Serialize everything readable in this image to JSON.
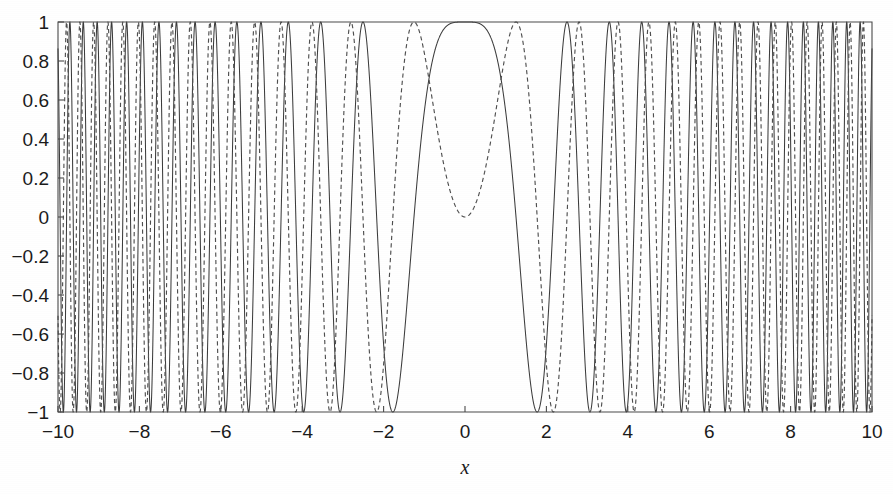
{
  "figure": {
    "background_color": "#ffffff",
    "line_color": "#3c3c3c",
    "axis_color": "#4a4a4a"
  },
  "chart_data": {
    "type": "line",
    "title": "",
    "subtitle": "",
    "xlabel": "x",
    "ylabel": "",
    "xlim": [
      -10,
      10
    ],
    "ylim": [
      -1,
      1
    ],
    "grid": false,
    "legend": "none",
    "xticks": [
      -10,
      -8,
      -6,
      -4,
      -2,
      0,
      2,
      4,
      6,
      8,
      10
    ],
    "xticklabels": [
      "−10",
      "−8",
      "−6",
      "−4",
      "−2",
      "0",
      "2",
      "4",
      "6",
      "8",
      "10"
    ],
    "yticks": [
      -1,
      -0.8,
      -0.6,
      -0.4,
      -0.2,
      0,
      0.2,
      0.4,
      0.6,
      0.8,
      1
    ],
    "yticklabels": [
      "−1",
      "−0.8",
      "−0.6",
      "−0.4",
      "−0.2",
      "0",
      "0.2",
      "0.4",
      "0.6",
      "0.8",
      "1"
    ],
    "series": [
      {
        "name": "solid-chirp",
        "linestyle": "solid",
        "color": "#3c3c3c",
        "formula": "cos(x^2)",
        "description": "Solid chirp: broad maximum of 1 at x = 0, oscillation frequency increasing with |x|, first minimum of -1 near x = ±1.77, amplitude constant between -1 and 1 across the full domain."
      },
      {
        "name": "dashed-chirp",
        "linestyle": "dashed",
        "color": "#4f4f4f",
        "formula": "sin(x^2)",
        "description": "Dashed chirp: touches 0 with a local minimum at x = 0, first maxima of 1 near x = ±1.25, oscillation frequency increasing with |x|, amplitude constant between -1 and 1."
      }
    ],
    "annotations": [],
    "sampling": {
      "x_start": -10,
      "x_end": 10,
      "num_points": 8000
    }
  }
}
